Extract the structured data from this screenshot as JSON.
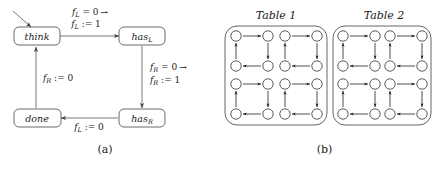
{
  "figure": {
    "panels": [
      {
        "id": "a",
        "caption": "(a)",
        "type": "state-machine",
        "states": [
          {
            "id": "think",
            "label": "think",
            "base": "think",
            "sub": "",
            "x": 36,
            "y": 36,
            "initial": true
          },
          {
            "id": "hasL",
            "label": "hasL",
            "base": "has",
            "sub": "L",
            "x": 142,
            "y": 36,
            "initial": false
          },
          {
            "id": "hasR",
            "label": "hasR",
            "base": "has",
            "sub": "R",
            "x": 142,
            "y": 118,
            "initial": false
          },
          {
            "id": "done",
            "label": "done",
            "base": "done",
            "sub": "",
            "x": 36,
            "y": 118,
            "initial": false
          }
        ],
        "transitions": [
          {
            "id": "think-to-hasL",
            "from": "think",
            "to": "hasL",
            "guard_base": "f",
            "guard_sub": "L",
            "guard_rest": " = 0",
            "arrow": "→",
            "action_base": "f",
            "action_sub": "L",
            "action_rest": " := 1",
            "label_line1": "fL = 0 →",
            "label_line2": "fL := 1"
          },
          {
            "id": "hasL-to-hasR",
            "from": "hasL",
            "to": "hasR",
            "guard_base": "f",
            "guard_sub": "R",
            "guard_rest": " = 0",
            "arrow": "→",
            "action_base": "f",
            "action_sub": "R",
            "action_rest": " := 1",
            "label_line1": "fR = 0 →",
            "label_line2": "fR := 1"
          },
          {
            "id": "hasR-to-done",
            "from": "hasR",
            "to": "done",
            "guard_base": "",
            "guard_sub": "",
            "guard_rest": "",
            "arrow": "",
            "action_base": "f",
            "action_sub": "L",
            "action_rest": " := 0",
            "label_line1": "fL := 0",
            "label_line2": ""
          },
          {
            "id": "done-to-think",
            "from": "done",
            "to": "think",
            "guard_base": "",
            "guard_sub": "",
            "guard_rest": "",
            "arrow": "",
            "action_base": "f",
            "action_sub": "R",
            "action_rest": " := 0",
            "label_line1": "fR := 0",
            "label_line2": ""
          }
        ]
      },
      {
        "id": "b",
        "caption": "(b)",
        "type": "table-diagram",
        "tables": [
          {
            "id": "table-1",
            "title": "Table 1",
            "clusters": [
              {
                "id": "t1-c1",
                "nodes": 4,
                "cycle": "clockwise"
              },
              {
                "id": "t1-c2",
                "nodes": 4,
                "cycle": "clockwise"
              },
              {
                "id": "t1-c3",
                "nodes": 4,
                "cycle": "clockwise"
              },
              {
                "id": "t1-c4",
                "nodes": 4,
                "cycle": "clockwise"
              }
            ]
          },
          {
            "id": "table-2",
            "title": "Table 2",
            "clusters": [
              {
                "id": "t2-c1",
                "nodes": 4,
                "cycle": "clockwise"
              },
              {
                "id": "t2-c2",
                "nodes": 4,
                "cycle": "clockwise"
              },
              {
                "id": "t2-c3",
                "nodes": 4,
                "cycle": "clockwise"
              },
              {
                "id": "t2-c4",
                "nodes": 4,
                "cycle": "clockwise"
              }
            ]
          }
        ]
      }
    ]
  },
  "colors": {
    "background": "#ffffff",
    "stroke": "#555555",
    "node_stroke": "#444444",
    "text": "#1a1a1a"
  }
}
